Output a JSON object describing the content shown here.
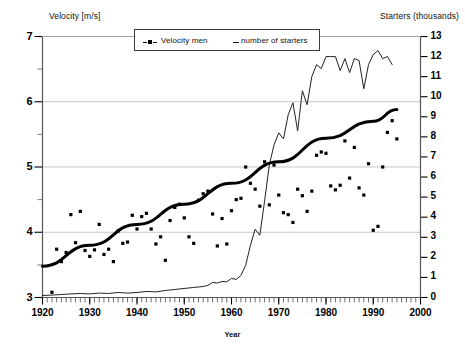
{
  "chart_data": {
    "type": "scatter",
    "title": "",
    "subtitle": "",
    "xlabel": "Year",
    "ylabel_left": "Velocity [m/s]",
    "ylabel_right": "Starters (thousands)",
    "xlim": [
      1920,
      2000
    ],
    "ylim_left": [
      3,
      7
    ],
    "ylim_right": [
      0,
      13
    ],
    "x_ticks": [
      1920,
      1930,
      1940,
      1950,
      1960,
      1970,
      1980,
      1990,
      2000
    ],
    "x_tick_labels": [
      "1920",
      "1930",
      "1940",
      "1950",
      "1960",
      "1970",
      "1980",
      "1990",
      "2000"
    ],
    "x_minor_tick_step": 1,
    "y_ticks_left": [
      3,
      4,
      5,
      6,
      7
    ],
    "y_tick_labels_left": [
      "3",
      "4",
      "5",
      "6",
      "7"
    ],
    "y_minor_tick_step_left": 0.5,
    "y_ticks_right": [
      0,
      1,
      2,
      3,
      4,
      5,
      6,
      7,
      8,
      9,
      10,
      11,
      12,
      13
    ],
    "y_tick_labels_right": [
      "0",
      "1",
      "2",
      "3",
      "4",
      "5",
      "6",
      "7",
      "8",
      "9",
      "10",
      "11",
      "12",
      "13"
    ],
    "grid": "horizontal-major-left",
    "grid_color": "#b9b9b9",
    "legend_position": "top-center",
    "legend": [
      {
        "label": "Velocity men",
        "marker": "square-dot",
        "axis": "left",
        "color": "#000000"
      },
      {
        "label": "number of starters",
        "marker": "line",
        "axis": "right",
        "color": "#111111"
      }
    ],
    "series": [
      {
        "name": "Velocity men",
        "type": "scatter",
        "axis": "left",
        "marker": "square",
        "color": "#000000",
        "points": [
          [
            1922,
            3.08
          ],
          [
            1923,
            3.74
          ],
          [
            1924,
            3.55
          ],
          [
            1925,
            3.69
          ],
          [
            1926,
            4.27
          ],
          [
            1927,
            3.84
          ],
          [
            1928,
            4.32
          ],
          [
            1929,
            3.72
          ],
          [
            1930,
            3.63
          ],
          [
            1931,
            3.73
          ],
          [
            1932,
            4.12
          ],
          [
            1933,
            3.66
          ],
          [
            1934,
            3.74
          ],
          [
            1935,
            3.55
          ],
          [
            1936,
            4.02
          ],
          [
            1937,
            3.83
          ],
          [
            1938,
            3.85
          ],
          [
            1939,
            4.26
          ],
          [
            1940,
            4.05
          ],
          [
            1941,
            4.24
          ],
          [
            1942,
            4.29
          ],
          [
            1943,
            4.05
          ],
          [
            1944,
            3.82
          ],
          [
            1945,
            3.93
          ],
          [
            1946,
            3.57
          ],
          [
            1947,
            4.18
          ],
          [
            1948,
            4.38
          ],
          [
            1949,
            4.43
          ],
          [
            1950,
            4.22
          ],
          [
            1951,
            3.93
          ],
          [
            1952,
            3.83
          ],
          [
            1953,
            4.49
          ],
          [
            1954,
            4.59
          ],
          [
            1955,
            4.63
          ],
          [
            1956,
            4.28
          ],
          [
            1957,
            3.79
          ],
          [
            1958,
            4.21
          ],
          [
            1959,
            3.82
          ],
          [
            1960,
            4.33
          ],
          [
            1961,
            4.5
          ],
          [
            1962,
            4.52
          ],
          [
            1963,
            5.0
          ],
          [
            1964,
            4.75
          ],
          [
            1965,
            4.66
          ],
          [
            1966,
            4.4
          ],
          [
            1967,
            5.08
          ],
          [
            1968,
            4.42
          ],
          [
            1969,
            5.03
          ],
          [
            1970,
            4.57
          ],
          [
            1971,
            4.3
          ],
          [
            1972,
            4.27
          ],
          [
            1973,
            4.15
          ],
          [
            1974,
            4.66
          ],
          [
            1975,
            4.56
          ],
          [
            1976,
            4.32
          ],
          [
            1977,
            4.63
          ],
          [
            1978,
            5.18
          ],
          [
            1979,
            5.23
          ],
          [
            1980,
            5.21
          ],
          [
            1981,
            4.71
          ],
          [
            1982,
            4.65
          ],
          [
            1983,
            4.72
          ],
          [
            1984,
            5.4
          ],
          [
            1985,
            4.83
          ],
          [
            1986,
            5.3
          ],
          [
            1987,
            4.68
          ],
          [
            1988,
            4.57
          ],
          [
            1989,
            5.05
          ],
          [
            1990,
            4.03
          ],
          [
            1991,
            4.09
          ],
          [
            1992,
            5.0
          ],
          [
            1993,
            5.53
          ],
          [
            1994,
            5.71
          ],
          [
            1995,
            5.43
          ]
        ]
      },
      {
        "name": "Velocity men trend",
        "type": "line",
        "axis": "left",
        "color": "#000000",
        "linewidth": 3,
        "points": [
          [
            1920,
            3.48
          ],
          [
            1930,
            3.8
          ],
          [
            1940,
            4.12
          ],
          [
            1950,
            4.43
          ],
          [
            1960,
            4.75
          ],
          [
            1970,
            5.08
          ],
          [
            1980,
            5.44
          ],
          [
            1990,
            5.7
          ],
          [
            1995,
            5.88
          ]
        ]
      },
      {
        "name": "number of starters",
        "type": "line",
        "axis": "right",
        "color": "#222222",
        "linewidth": 1,
        "points": [
          [
            1920,
            0.1
          ],
          [
            1922,
            0.12
          ],
          [
            1924,
            0.15
          ],
          [
            1926,
            0.18
          ],
          [
            1928,
            0.2
          ],
          [
            1930,
            0.18
          ],
          [
            1932,
            0.22
          ],
          [
            1934,
            0.2
          ],
          [
            1936,
            0.25
          ],
          [
            1938,
            0.22
          ],
          [
            1940,
            0.25
          ],
          [
            1942,
            0.3
          ],
          [
            1944,
            0.28
          ],
          [
            1946,
            0.35
          ],
          [
            1948,
            0.4
          ],
          [
            1950,
            0.45
          ],
          [
            1952,
            0.5
          ],
          [
            1954,
            0.55
          ],
          [
            1955,
            0.6
          ],
          [
            1956,
            0.75
          ],
          [
            1957,
            0.72
          ],
          [
            1958,
            0.8
          ],
          [
            1959,
            0.78
          ],
          [
            1960,
            0.95
          ],
          [
            1961,
            0.9
          ],
          [
            1962,
            1.1
          ],
          [
            1963,
            1.6
          ],
          [
            1964,
            2.6
          ],
          [
            1965,
            3.4
          ],
          [
            1966,
            3.1
          ],
          [
            1967,
            4.8
          ],
          [
            1968,
            6.6
          ],
          [
            1969,
            7.6
          ],
          [
            1970,
            8.2
          ],
          [
            1971,
            7.9
          ],
          [
            1972,
            9.1
          ],
          [
            1973,
            9.7
          ],
          [
            1974,
            8.3
          ],
          [
            1975,
            10.3
          ],
          [
            1976,
            9.6
          ],
          [
            1977,
            11.0
          ],
          [
            1978,
            11.6
          ],
          [
            1979,
            11.4
          ],
          [
            1980,
            12.0
          ],
          [
            1981,
            12.0
          ],
          [
            1982,
            12.0
          ],
          [
            1983,
            11.3
          ],
          [
            1984,
            11.9
          ],
          [
            1985,
            11.2
          ],
          [
            1986,
            11.9
          ],
          [
            1987,
            11.8
          ],
          [
            1988,
            10.4
          ],
          [
            1989,
            11.6
          ],
          [
            1990,
            12.1
          ],
          [
            1991,
            12.3
          ],
          [
            1992,
            11.9
          ],
          [
            1993,
            12.0
          ],
          [
            1994,
            11.6
          ]
        ]
      }
    ]
  }
}
